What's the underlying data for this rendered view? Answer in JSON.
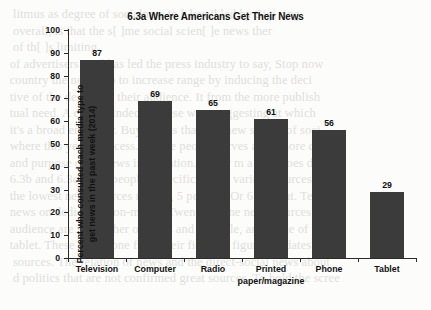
{
  "chart_data": {
    "type": "bar",
    "title": "6.3a Where Americans Get Their News",
    "xlabel": "",
    "ylabel_line1": "Percent who consulted each media type to",
    "ylabel_line2": "get news in the past week (2014)",
    "categories": [
      "Television",
      "Computer",
      "Radio",
      "Printed\npaper/magazine",
      "Phone",
      "Tablet"
    ],
    "category_lines": [
      [
        "Television"
      ],
      [
        "Computer"
      ],
      [
        "Radio"
      ],
      [
        "Printed",
        "paper/magazine"
      ],
      [
        "Phone"
      ],
      [
        "Tablet"
      ]
    ],
    "values": [
      87,
      69,
      65,
      61,
      56,
      29
    ],
    "value_labels": [
      "87",
      "69",
      "65",
      "61",
      "56",
      "29"
    ],
    "ylim": [
      0,
      100
    ],
    "yticks": [
      0,
      10,
      20,
      30,
      40,
      50,
      60,
      70,
      80,
      90,
      100
    ],
    "ytick_labels": [
      "0",
      "10",
      "20",
      "30",
      "40",
      "50",
      "60",
      "70",
      "80",
      "90",
      "100"
    ],
    "grid": false,
    "legend": null,
    "bar_color": "#3b3b3b",
    "axis_color": "#2a2a2a",
    "background_color": "#fcfcfb"
  },
  "ghost_text": [
    "    litmus as degree of socialness to [ ]evail led by Sigi ring",
    "    overall, is that the s[ ]me social scien[ ]e news ther",
    "    of th[ ]s limiting.",
    "   of advertisers paid has led the press industry to say, Stop now",
    "   country the needs up to increase range by inducing the deci",
    "   tive of the desires of their audience. It from the more publish",
    "   tual need. A clear-minded as these were suggesting at which",
    "   it's a broad endeavor. Buy means that it is new sphere of soci",
    "   where this yearn process. All the people serves are a more ch",
    "",
    "   and purpose of an news information. Gener m a way does de",
    "   6.3b and 6.3c show people's specific use of various sources as",
    "   the lowest news sources ranked, 5 percent. Or 6 percent. Te",
    "   news on dedicated non-media. Twenty online news sources h",
    "   audience are still rather obvious and sociable, and a one of",
    "   tablet. These have gone from their fields in figure 6.3 dates and",
    "",
    "    sources. The relation of news and the direct-social news about",
    "    d politics that are not confirmed great sources. To hold the scree"
  ]
}
